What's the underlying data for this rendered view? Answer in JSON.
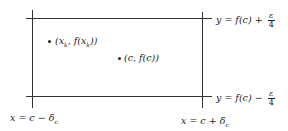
{
  "diagram": {
    "lines": {
      "top": {
        "label_prefix": "y = f(c) + ",
        "frac_num": "ε",
        "frac_den": "4"
      },
      "bottom": {
        "label_prefix": "y = f(c) − ",
        "frac_num": "ε",
        "frac_den": "4"
      },
      "left": {
        "label": "x = c − δ_c",
        "label_main": "x = c − δ",
        "label_sub": "c"
      },
      "right": {
        "label": "x = c + δ_c",
        "label_main": "x = c + δ",
        "label_sub": "c"
      }
    },
    "points": [
      {
        "label": "(x_k, f(x_k))",
        "text_a": "(x",
        "sub_a": "k",
        "text_b": ", f(x",
        "sub_b": "k",
        "text_c": "))"
      },
      {
        "label": "(c, f(c))",
        "text": "(c, f(c))"
      }
    ],
    "colors": {
      "line": "#333333",
      "text": "#222222",
      "background": "#ffffff"
    }
  }
}
